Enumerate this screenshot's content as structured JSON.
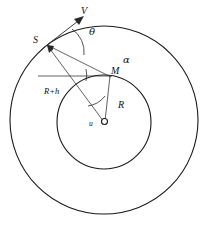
{
  "figure": {
    "background_color": "#ffffff",
    "stroke_color": "#1a1a1a",
    "width": 207,
    "height": 227
  },
  "labels": {
    "velocity": "V",
    "theta": "θ",
    "alpha": "α",
    "point_s": "S",
    "point_m": "M",
    "radius_outer": "R+h",
    "radius_inner": "R",
    "center_u": "u",
    "center_o": ""
  },
  "geometry": {
    "center": {
      "x": 104,
      "y": 122
    },
    "outer_circle": {
      "cx": 104,
      "cy": 120,
      "r": 94,
      "label": "R+h"
    },
    "inner_circle": {
      "cx": 104,
      "cy": 122,
      "r": 47,
      "label": "R"
    },
    "point_s": {
      "x": 47,
      "y": 45
    },
    "point_m": {
      "x": 110,
      "y": 76
    },
    "point_o": {
      "x": 104,
      "y": 122
    },
    "velocity_arrow": {
      "from_x": 47,
      "from_y": 45,
      "to_x": 84,
      "to_y": 15
    },
    "angles": [
      {
        "name": "theta",
        "symbol": "θ",
        "at": "S",
        "label_x": 92,
        "label_y": 33
      },
      {
        "name": "alpha",
        "symbol": "α",
        "at": "M",
        "label_x": 124,
        "label_y": 62
      },
      {
        "name": "u",
        "symbol": "u",
        "at": "O",
        "label_x": 92,
        "label_y": 125
      }
    ]
  },
  "annotations": {
    "s_label_pos": {
      "x": 34,
      "y": 42
    },
    "m_label_pos": {
      "x": 112,
      "y": 74
    },
    "v_label_pos": {
      "x": 84,
      "y": 14
    },
    "rh_label_pos": {
      "x": 48,
      "y": 92
    },
    "r_label_pos": {
      "x": 120,
      "y": 107
    }
  }
}
